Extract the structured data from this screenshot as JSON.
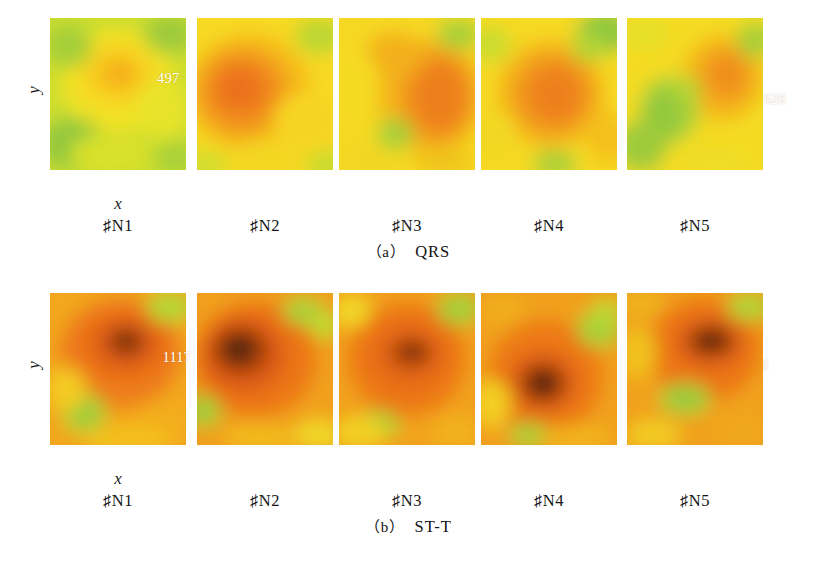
{
  "figure": {
    "axis_x_label": "x",
    "axis_y_label": "y",
    "background_color": "#ffffff"
  },
  "palette": {
    "green": "#8cc63f",
    "yellow_green": "#c2d92f",
    "yellow": "#f7e023",
    "gold": "#f9c81e",
    "orange": "#f08b1d",
    "deep_orange": "#e2661a",
    "red_orange": "#c94a12",
    "dark_brown": "#4b2208",
    "value_text_color": "#ffffff"
  },
  "subcaptions": {
    "a": {
      "index": "（a）",
      "text": "QRS"
    },
    "b": {
      "index": "（b）",
      "text": "ST-T"
    }
  },
  "footer_note": "",
  "chart_data": [
    {
      "type": "heatmap",
      "title": "QRS",
      "panel_group": "a",
      "xlabel": "x",
      "ylabel": "y",
      "grid": false,
      "legend": "none",
      "colormap": [
        "#8cc63f",
        "#c2d92f",
        "#f7e023",
        "#f9c81e",
        "#f08b1d",
        "#e2661a",
        "#c94a12",
        "#4b2208"
      ],
      "panels": [
        {
          "label": "♯N1",
          "value": 497,
          "peak_x": 0.5,
          "peak_y": 0.37,
          "peak_level": "gold",
          "value_label_x": 0.42,
          "value_label_y": 0.34
        },
        {
          "label": "♯N2",
          "value": 791,
          "peak_x": 0.36,
          "peak_y": 0.5,
          "peak_level": "deep_orange",
          "value_label_x": 0.34,
          "value_label_y": 0.42
        },
        {
          "label": "♯N3",
          "value": 628,
          "peak_x": 0.72,
          "peak_y": 0.52,
          "peak_level": "orange",
          "value_label_x": 0.63,
          "value_label_y": 0.48
        },
        {
          "label": "♯N4",
          "value": 737,
          "peak_x": 0.52,
          "peak_y": 0.5,
          "peak_level": "deep_orange",
          "value_label_x": 0.56,
          "value_label_y": 0.58
        },
        {
          "label": "♯N5",
          "value": 1078,
          "peak_x": 0.72,
          "peak_y": 0.4,
          "peak_level": "orange",
          "value_label_x": 0.62,
          "value_label_y": 0.38
        }
      ]
    },
    {
      "type": "heatmap",
      "title": "ST-T",
      "panel_group": "b",
      "xlabel": "x",
      "ylabel": "y",
      "grid": false,
      "legend": "none",
      "colormap": [
        "#8cc63f",
        "#c2d92f",
        "#f7e023",
        "#f9c81e",
        "#f08b1d",
        "#e2661a",
        "#c94a12",
        "#4b2208"
      ],
      "panels": [
        {
          "label": "♯N1",
          "value": 1117,
          "peak_x": 0.55,
          "peak_y": 0.33,
          "peak_level": "dark_brown",
          "value_label_x": 0.46,
          "value_label_y": 0.37
        },
        {
          "label": "♯N2",
          "value": 941,
          "peak_x": 0.35,
          "peak_y": 0.4,
          "peak_level": "dark_brown",
          "value_label_x": 0.3,
          "value_label_y": 0.44
        },
        {
          "label": "♯N3",
          "value": 878,
          "peak_x": 0.55,
          "peak_y": 0.4,
          "peak_level": "dark_brown",
          "value_label_x": 0.5,
          "value_label_y": 0.42
        },
        {
          "label": "♯N4",
          "value": 1020,
          "peak_x": 0.5,
          "peak_y": 0.55,
          "peak_level": "dark_brown",
          "value_label_x": 0.46,
          "value_label_y": 0.53
        },
        {
          "label": "♯N5",
          "value": 2109,
          "peak_x": 0.6,
          "peak_y": 0.33,
          "peak_level": "dark_brown",
          "value_label_x": 0.52,
          "value_label_y": 0.36
        }
      ]
    }
  ]
}
